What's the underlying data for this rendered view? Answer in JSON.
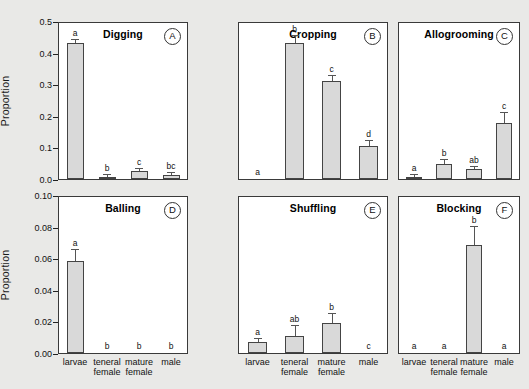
{
  "figure": {
    "background_color": "#e9e9e7",
    "panel_background": "#ffffff",
    "bar_fill": "#d9d9d9",
    "bar_edge": "#444444",
    "y_axis_label": "Proportion"
  },
  "categories": [
    {
      "line1": "larvae",
      "line2": ""
    },
    {
      "line1": "teneral",
      "line2": "female"
    },
    {
      "line1": "mature",
      "line2": "female"
    },
    {
      "line1": "male",
      "line2": ""
    }
  ],
  "axes": {
    "top_row": {
      "ticks": [
        "0.0",
        "0.1",
        "0.2",
        "0.3",
        "0.4",
        "0.5"
      ],
      "min": 0.0,
      "max": 0.5
    },
    "bottom_row": {
      "ticks": [
        "0.00",
        "0.02",
        "0.04",
        "0.06",
        "0.08",
        "0.10"
      ],
      "min": 0.0,
      "max": 0.1
    }
  },
  "chart_data": [
    {
      "type": "bar",
      "panel": "A",
      "title": "Digging",
      "categories": [
        "larvae",
        "teneral female",
        "mature female",
        "male"
      ],
      "values": [
        0.435,
        0.008,
        0.025,
        0.014
      ],
      "errors": [
        0.012,
        0.004,
        0.008,
        0.006
      ],
      "letters": [
        "a",
        "b",
        "c",
        "bc"
      ],
      "xlabel": "",
      "ylabel": "Proportion",
      "ylim": [
        0.0,
        0.5
      ],
      "grid": false,
      "legend": "none"
    },
    {
      "type": "bar",
      "panel": "B",
      "title": "Cropping",
      "categories": [
        "larvae",
        "teneral female",
        "mature female",
        "male"
      ],
      "values": [
        0.0,
        0.437,
        0.315,
        0.105
      ],
      "errors": [
        0.0,
        0.022,
        0.016,
        0.018
      ],
      "letters": [
        "a",
        "b",
        "c",
        "d"
      ],
      "xlabel": "",
      "ylabel": "Proportion",
      "ylim": [
        0.0,
        0.5
      ],
      "grid": false,
      "legend": "none"
    },
    {
      "type": "bar",
      "panel": "C",
      "title": "Allogrooming",
      "categories": [
        "larvae",
        "teneral female",
        "mature female",
        "male"
      ],
      "values": [
        0.008,
        0.048,
        0.032,
        0.181
      ],
      "errors": [
        0.004,
        0.012,
        0.006,
        0.031
      ],
      "letters": [
        "a",
        "b",
        "ab",
        "c"
      ],
      "xlabel": "",
      "ylabel": "Proportion",
      "ylim": [
        0.0,
        0.5
      ],
      "grid": false,
      "legend": "none"
    },
    {
      "type": "bar",
      "panel": "D",
      "title": "Balling",
      "categories": [
        "larvae",
        "teneral female",
        "mature female",
        "male"
      ],
      "values": [
        0.059,
        0.0,
        0.0,
        0.0
      ],
      "errors": [
        0.007,
        0.0,
        0.0,
        0.0
      ],
      "letters": [
        "a",
        "b",
        "b",
        "b"
      ],
      "xlabel": "",
      "ylabel": "Proportion",
      "ylim": [
        0.0,
        0.1
      ],
      "grid": false,
      "legend": "none"
    },
    {
      "type": "bar",
      "panel": "E",
      "title": "Shuffling",
      "categories": [
        "larvae",
        "teneral female",
        "mature female",
        "male"
      ],
      "values": [
        0.007,
        0.011,
        0.019,
        0.0
      ],
      "errors": [
        0.002,
        0.006,
        0.006,
        0.0
      ],
      "letters": [
        "a",
        "ab",
        "b",
        "c"
      ],
      "xlabel": "",
      "ylabel": "Proportion",
      "ylim": [
        0.0,
        0.1
      ],
      "grid": false,
      "legend": "none"
    },
    {
      "type": "bar",
      "panel": "F",
      "title": "Blocking",
      "categories": [
        "larvae",
        "teneral female",
        "mature female",
        "male"
      ],
      "values": [
        0.0,
        0.0,
        0.069,
        0.0
      ],
      "errors": [
        0.0,
        0.0,
        0.012,
        0.0
      ],
      "letters": [
        "a",
        "a",
        "b",
        "a"
      ],
      "xlabel": "",
      "ylabel": "Proportion",
      "ylim": [
        0.0,
        0.1
      ],
      "grid": false,
      "legend": "none"
    }
  ]
}
